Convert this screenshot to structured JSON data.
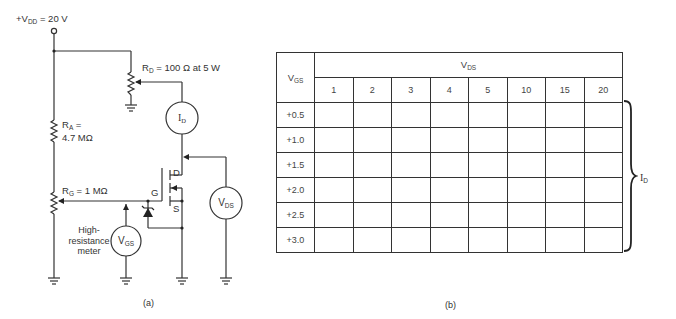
{
  "figure_a": {
    "caption": "(a)",
    "supply": {
      "prefix": "+V",
      "sub": "DD",
      "value": " = 20 V"
    },
    "rd": {
      "prefix": "R",
      "sub": "D",
      "value": " = 100 Ω at 5 W"
    },
    "ra": {
      "prefix": "R",
      "sub": "A",
      "line1_suffix": " =",
      "line2": "4.7 MΩ"
    },
    "rg": {
      "prefix": "R",
      "sub": "G",
      "value": " = 1 MΩ"
    },
    "mosfet": {
      "gate": "G",
      "drain": "D",
      "source": "S"
    },
    "meters": {
      "id": {
        "main": "I",
        "sub": "D"
      },
      "vds": {
        "main": "V",
        "sub": "DS"
      },
      "vgs": {
        "main": "V",
        "sub": "GS"
      }
    },
    "meter_note": {
      "line1": "High-",
      "line2": "resistance",
      "line3": "meter"
    }
  },
  "figure_b": {
    "caption": "(b)",
    "row_header": {
      "main": "V",
      "sub": "GS"
    },
    "col_group_header": {
      "main": "V",
      "sub": "DS"
    },
    "columns": [
      "1",
      "2",
      "3",
      "4",
      "5",
      "10",
      "15",
      "20"
    ],
    "rows": [
      "+0.5",
      "+1.0",
      "+1.5",
      "+2.0",
      "+2.5",
      "+3.0"
    ],
    "cells": [
      [
        "",
        "",
        "",
        "",
        "",
        "",
        "",
        ""
      ],
      [
        "",
        "",
        "",
        "",
        "",
        "",
        "",
        ""
      ],
      [
        "",
        "",
        "",
        "",
        "",
        "",
        "",
        ""
      ],
      [
        "",
        "",
        "",
        "",
        "",
        "",
        "",
        ""
      ],
      [
        "",
        "",
        "",
        "",
        "",
        "",
        "",
        ""
      ],
      [
        "",
        "",
        "",
        "",
        "",
        "",
        "",
        ""
      ]
    ],
    "brace_label": {
      "main": "I",
      "sub": "D"
    }
  }
}
